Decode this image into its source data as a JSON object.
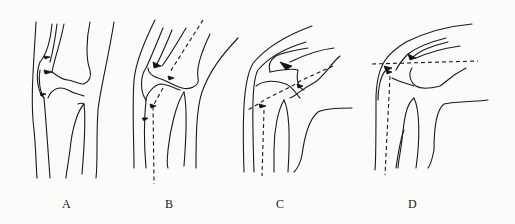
{
  "figure": {
    "panels": [
      {
        "id": "A",
        "label": "A",
        "pose": "extension"
      },
      {
        "id": "B",
        "label": "B",
        "pose": "slight flexion"
      },
      {
        "id": "C",
        "label": "C",
        "pose": "moderate flexion"
      },
      {
        "id": "D",
        "label": "D",
        "pose": "deep flexion"
      }
    ]
  },
  "colors": {
    "line": "#1a1a1a",
    "background": "#fbfbfa"
  }
}
